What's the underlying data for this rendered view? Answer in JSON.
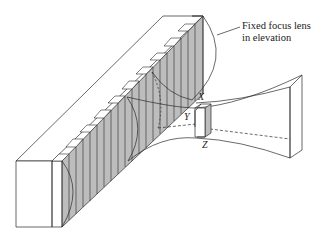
{
  "figure": {
    "callout": {
      "line1": "Fixed focus lens",
      "line2": "in elevation"
    },
    "axes": {
      "x": "X",
      "y": "Y",
      "z": "Z"
    },
    "colors": {
      "stroke": "#2a2a2a",
      "element_fill": "#bdbdbd",
      "background": "#ffffff"
    },
    "element_count": 22
  }
}
